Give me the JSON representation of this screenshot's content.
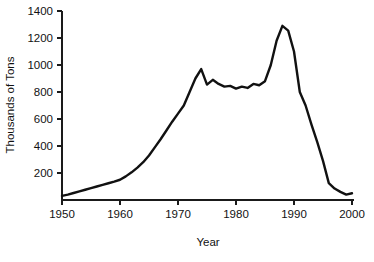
{
  "chart_data": {
    "type": "line",
    "title": "",
    "xlabel": "Year",
    "ylabel": "Thousands of Tons",
    "xlim": [
      1950,
      2000
    ],
    "ylim": [
      0,
      1400
    ],
    "grid": false,
    "legend": null,
    "xticks": [
      1950,
      1960,
      1970,
      1980,
      1990,
      2000
    ],
    "xtick_labels": [
      "1950",
      "1960",
      "1970",
      "1980",
      "1990",
      "2000"
    ],
    "yticks": [
      200,
      400,
      600,
      800,
      1000,
      1200,
      1400
    ],
    "ytick_labels": [
      "200",
      "400",
      "600",
      "800",
      "1000",
      "1200",
      "1400"
    ],
    "series": [
      {
        "name": "Production",
        "color": "#111111",
        "x": [
          1950,
          1951,
          1952,
          1953,
          1954,
          1955,
          1956,
          1957,
          1958,
          1959,
          1960,
          1961,
          1962,
          1963,
          1964,
          1965,
          1966,
          1967,
          1968,
          1969,
          1970,
          1971,
          1972,
          1973,
          1974,
          1975,
          1976,
          1977,
          1978,
          1979,
          1980,
          1981,
          1982,
          1983,
          1984,
          1985,
          1986,
          1987,
          1988,
          1989,
          1990,
          1991,
          1992,
          1993,
          1994,
          1995,
          1996,
          1997,
          1998,
          1999,
          2000
        ],
        "y": [
          30,
          40,
          52,
          64,
          76,
          88,
          100,
          112,
          124,
          136,
          150,
          175,
          205,
          240,
          280,
          330,
          390,
          450,
          515,
          580,
          640,
          700,
          800,
          900,
          970,
          855,
          890,
          860,
          840,
          845,
          825,
          840,
          830,
          860,
          850,
          880,
          1000,
          1180,
          1290,
          1255,
          1100,
          800,
          700,
          560,
          430,
          290,
          125,
          85,
          60,
          40,
          50
        ]
      }
    ]
  },
  "axes": {
    "ylabel_text": "Thousands of Tons",
    "xlabel_text": "Year"
  }
}
